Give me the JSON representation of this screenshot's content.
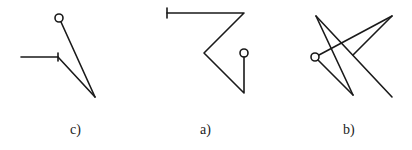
{
  "figures": [
    {
      "id": "c",
      "label": "c)"
    },
    {
      "id": "a",
      "label": "a)"
    },
    {
      "id": "b",
      "label": "b)"
    }
  ],
  "colors": {
    "stroke": "#1a1a1a",
    "background": "#ffffff"
  }
}
